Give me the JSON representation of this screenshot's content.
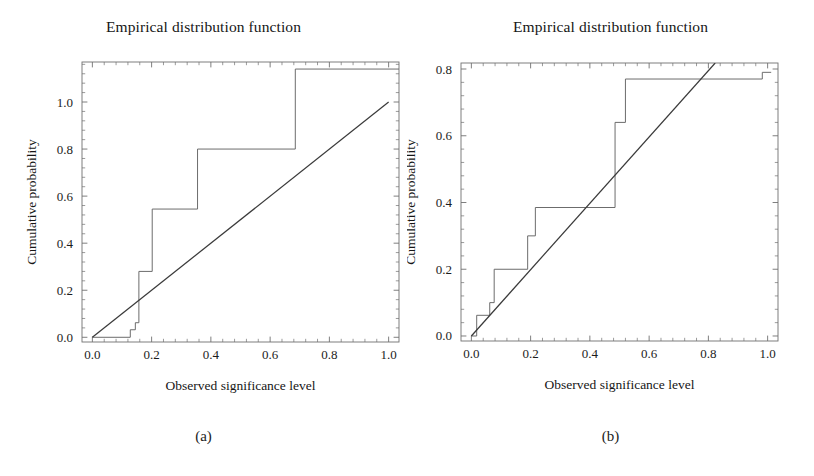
{
  "figure": {
    "width": 814,
    "height": 476,
    "background": "#ffffff",
    "line_color": "#555555",
    "diagonal_color": "#3a3a3a",
    "axis_color": "#707070",
    "text_color": "#1a1a1a"
  },
  "panels": [
    {
      "id": "a",
      "caption": "(a)",
      "title": "Empirical distribution function",
      "xlabel": "Observed significance level",
      "ylabel": "Cumulative probability"
    },
    {
      "id": "b",
      "caption": "(b)",
      "title": "Empirical distribution function",
      "xlabel": "Observed significance level",
      "ylabel": "Cumulative probability"
    }
  ],
  "chart_data": [
    {
      "type": "line",
      "panel": "a",
      "title": "Empirical distribution function",
      "xlabel": "Observed significance level",
      "ylabel": "Cumulative probability",
      "xlim": [
        -0.035,
        1.035
      ],
      "ylim": [
        -0.02,
        1.17
      ],
      "xticks": [
        0.0,
        0.2,
        0.4,
        0.6,
        0.8,
        1.0
      ],
      "xticklabels": [
        "0.0",
        "0.2",
        "0.4",
        "0.6",
        "0.8",
        "1.0"
      ],
      "yticks": [
        0.0,
        0.2,
        0.4,
        0.6,
        0.8,
        1.0
      ],
      "yticklabels": [
        "0.0",
        "0.2",
        "0.4",
        "0.6",
        "0.8",
        "1.0"
      ],
      "grid": false,
      "legend": null,
      "series": [
        {
          "name": "Empirical CDF (step)",
          "style": "step-post",
          "color": "#646464",
          "x": [
            0.0,
            0.128,
            0.128,
            0.145,
            0.145,
            0.157,
            0.157,
            0.202,
            0.202,
            0.355,
            0.355,
            0.685,
            0.685,
            1.035
          ],
          "y": [
            0.0,
            0.0,
            0.032,
            0.032,
            0.062,
            0.062,
            0.28,
            0.28,
            0.545,
            0.545,
            0.8,
            0.8,
            1.14,
            1.14
          ]
        },
        {
          "name": "Uniform reference line",
          "style": "straight",
          "color": "#3a3a3a",
          "x": [
            0.0,
            1.0
          ],
          "y": [
            0.0,
            1.0
          ]
        }
      ]
    },
    {
      "type": "line",
      "panel": "b",
      "title": "Empirical distribution function",
      "xlabel": "Observed significance level",
      "ylabel": "Cumulative probability",
      "xlim": [
        -0.035,
        1.035
      ],
      "ylim": [
        -0.015,
        0.818
      ],
      "xticks": [
        0.0,
        0.2,
        0.4,
        0.6,
        0.8,
        1.0
      ],
      "xticklabels": [
        "0.0",
        "0.2",
        "0.4",
        "0.6",
        "0.8",
        "1.0"
      ],
      "yticks": [
        0.0,
        0.2,
        0.4,
        0.6,
        0.8
      ],
      "yticklabels": [
        "0.0",
        "0.2",
        "0.4",
        "0.6",
        "0.8"
      ],
      "grid": false,
      "legend": null,
      "series": [
        {
          "name": "Empirical CDF (step)",
          "style": "step-post",
          "color": "#646464",
          "x": [
            0.0,
            0.018,
            0.018,
            0.062,
            0.062,
            0.077,
            0.077,
            0.19,
            0.19,
            0.216,
            0.216,
            0.485,
            0.485,
            0.52,
            0.52,
            0.982,
            0.982,
            1.012
          ],
          "y": [
            0.0,
            0.0,
            0.062,
            0.062,
            0.1,
            0.1,
            0.2,
            0.2,
            0.3,
            0.3,
            0.385,
            0.385,
            0.64,
            0.64,
            0.77,
            0.77,
            0.79,
            0.79
          ]
        },
        {
          "name": "Uniform reference line",
          "style": "straight",
          "color": "#3a3a3a",
          "x": [
            0.0,
            0.823
          ],
          "y": [
            0.0,
            0.818
          ]
        }
      ]
    }
  ]
}
